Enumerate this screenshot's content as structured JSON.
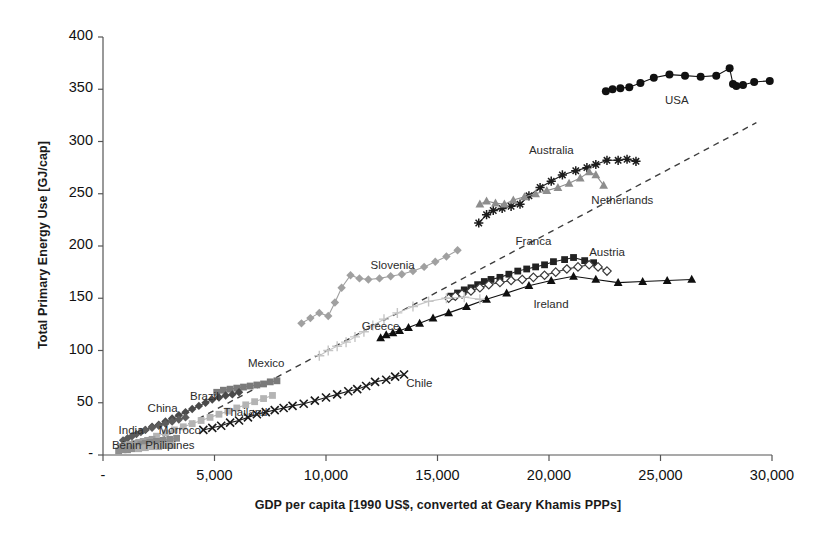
{
  "chart_data": {
    "type": "scatter",
    "title": "",
    "xlabel": "GDP per capita [1990 US$, converted at Geary Khamis PPPs]",
    "ylabel": "Total Primary Energy Use [GJ/cap]",
    "xlim": [
      0,
      30000
    ],
    "ylim": [
      0,
      400
    ],
    "grid": false,
    "legend": "none (series labelled inline on plot)",
    "xticks": [
      0,
      5000,
      10000,
      15000,
      20000,
      25000,
      30000
    ],
    "xticklabels": [
      "-",
      "5,000",
      "10,000",
      "15,000",
      "20,000",
      "25,000",
      "30,000"
    ],
    "yticks": [
      0,
      50,
      100,
      150,
      200,
      250,
      300,
      350,
      400
    ],
    "yticklabels": [
      "-",
      "50",
      "100",
      "150",
      "200",
      "250",
      "300",
      "350",
      "400"
    ],
    "annotations": [
      {
        "text": "USA",
        "x": 25200,
        "y": 338
      },
      {
        "text": "Australia",
        "x": 19100,
        "y": 290
      },
      {
        "text": "Netherlands",
        "x": 21900,
        "y": 242
      },
      {
        "text": "Franca",
        "x": 18500,
        "y": 203
      },
      {
        "text": "Austria",
        "x": 21800,
        "y": 192
      },
      {
        "text": "Ireland",
        "x": 19300,
        "y": 143
      },
      {
        "text": "Slovenia",
        "x": 12000,
        "y": 180
      },
      {
        "text": "Greece",
        "x": 11600,
        "y": 122
      },
      {
        "text": "Mexico",
        "x": 6500,
        "y": 86
      },
      {
        "text": "Chile",
        "x": 13600,
        "y": 67
      },
      {
        "text": "Thailand",
        "x": 5400,
        "y": 39
      },
      {
        "text": "Brazil",
        "x": 3900,
        "y": 55
      },
      {
        "text": "China",
        "x": 2000,
        "y": 43
      },
      {
        "text": "Morroco",
        "x": 2500,
        "y": 22
      },
      {
        "text": "India",
        "x": 700,
        "y": 22
      },
      {
        "text": "Philipines",
        "x": 1900,
        "y": 8
      },
      {
        "text": "Bénin",
        "x": 400,
        "y": 8
      }
    ],
    "trendline": {
      "name": "dashed-reference-line",
      "style": "dashed",
      "color": "#3d3d3d",
      "points": [
        [
          2100,
          10
        ],
        [
          29300,
          318
        ]
      ]
    },
    "series": [
      {
        "name": "USA",
        "marker": "filled-circle",
        "color": "#111111",
        "points": [
          [
            22550,
            348
          ],
          [
            22850,
            350
          ],
          [
            23200,
            351
          ],
          [
            23600,
            352
          ],
          [
            24100,
            356
          ],
          [
            24700,
            361
          ],
          [
            25400,
            364
          ],
          [
            26100,
            363
          ],
          [
            26800,
            362
          ],
          [
            27500,
            363
          ],
          [
            28100,
            370
          ],
          [
            28250,
            355
          ],
          [
            28400,
            353
          ],
          [
            28700,
            354
          ],
          [
            29200,
            357
          ],
          [
            29900,
            358
          ]
        ]
      },
      {
        "name": "Australia",
        "marker": "star",
        "color": "#1c1c1c",
        "points": [
          [
            16850,
            222
          ],
          [
            17200,
            230
          ],
          [
            17500,
            234
          ],
          [
            17900,
            236
          ],
          [
            18300,
            238
          ],
          [
            18700,
            240
          ],
          [
            19100,
            248
          ],
          [
            19600,
            256
          ],
          [
            20100,
            262
          ],
          [
            20600,
            268
          ],
          [
            21200,
            272
          ],
          [
            21700,
            275
          ],
          [
            22100,
            278
          ],
          [
            22600,
            282
          ],
          [
            23100,
            282
          ],
          [
            23500,
            283
          ],
          [
            23900,
            281
          ]
        ]
      },
      {
        "name": "Netherlands",
        "marker": "filled-triangle",
        "color": "#8d8d8d",
        "points": [
          [
            16900,
            240
          ],
          [
            17200,
            243
          ],
          [
            17600,
            241
          ],
          [
            18000,
            240
          ],
          [
            18400,
            244
          ],
          [
            18900,
            247
          ],
          [
            19400,
            250
          ],
          [
            19900,
            253
          ],
          [
            20400,
            256
          ],
          [
            20900,
            260
          ],
          [
            21400,
            265
          ],
          [
            21800,
            271
          ],
          [
            22100,
            268
          ],
          [
            22450,
            258
          ]
        ]
      },
      {
        "name": "Franca",
        "marker": "filled-square",
        "color": "#222222",
        "points": [
          [
            15600,
            152
          ],
          [
            15900,
            155
          ],
          [
            16200,
            158
          ],
          [
            16500,
            160
          ],
          [
            16800,
            163
          ],
          [
            17100,
            166
          ],
          [
            17400,
            168
          ],
          [
            17800,
            170
          ],
          [
            18200,
            173
          ],
          [
            18600,
            176
          ],
          [
            19000,
            178
          ],
          [
            19400,
            180
          ],
          [
            19800,
            182
          ],
          [
            20200,
            185
          ],
          [
            20700,
            187
          ],
          [
            21100,
            189
          ],
          [
            21600,
            186
          ],
          [
            22000,
            184
          ]
        ]
      },
      {
        "name": "Austria",
        "marker": "open-diamond",
        "color": "#3a3a3a",
        "points": [
          [
            15500,
            150
          ],
          [
            15800,
            152
          ],
          [
            16100,
            154
          ],
          [
            16500,
            157
          ],
          [
            16900,
            160
          ],
          [
            17300,
            163
          ],
          [
            17800,
            165
          ],
          [
            18300,
            167
          ],
          [
            18800,
            168
          ],
          [
            19300,
            170
          ],
          [
            19800,
            172
          ],
          [
            20300,
            175
          ],
          [
            20800,
            178
          ],
          [
            21300,
            180
          ],
          [
            21800,
            182
          ],
          [
            22200,
            180
          ],
          [
            22600,
            176
          ]
        ]
      },
      {
        "name": "Ireland",
        "marker": "filled-triangle",
        "color": "#0f0f0f",
        "points": [
          [
            12450,
            112
          ],
          [
            12700,
            115
          ],
          [
            13000,
            117
          ],
          [
            13300,
            119
          ],
          [
            13700,
            122
          ],
          [
            14200,
            126
          ],
          [
            14800,
            131
          ],
          [
            15500,
            136
          ],
          [
            16300,
            142
          ],
          [
            17200,
            149
          ],
          [
            18100,
            155
          ],
          [
            19100,
            162
          ],
          [
            20100,
            167
          ],
          [
            21100,
            171
          ],
          [
            22100,
            168
          ],
          [
            23100,
            165
          ],
          [
            24200,
            166
          ],
          [
            25300,
            167
          ],
          [
            26400,
            168
          ]
        ]
      },
      {
        "name": "Slovenia",
        "marker": "filled-diamond",
        "color": "#a0a0a0",
        "points": [
          [
            8900,
            126
          ],
          [
            9300,
            131
          ],
          [
            9700,
            136
          ],
          [
            10100,
            133
          ],
          [
            10400,
            146
          ],
          [
            10700,
            160
          ],
          [
            11100,
            172
          ],
          [
            11500,
            169
          ],
          [
            11900,
            168
          ],
          [
            12400,
            169
          ],
          [
            12900,
            171
          ],
          [
            13400,
            173
          ],
          [
            13900,
            176
          ],
          [
            14400,
            180
          ],
          [
            14900,
            185
          ],
          [
            15400,
            190
          ],
          [
            15900,
            196
          ]
        ]
      },
      {
        "name": "Greece",
        "marker": "thin-cross",
        "color": "#c5c5c5",
        "points": [
          [
            9700,
            95
          ],
          [
            10100,
            100
          ],
          [
            10500,
            104
          ],
          [
            10900,
            108
          ],
          [
            11300,
            113
          ],
          [
            11700,
            118
          ],
          [
            12100,
            124
          ],
          [
            12600,
            130
          ],
          [
            13200,
            136
          ],
          [
            13900,
            142
          ],
          [
            14600,
            147
          ],
          [
            15400,
            150
          ],
          [
            16200,
            151
          ],
          [
            16900,
            149
          ]
        ]
      },
      {
        "name": "Chile",
        "marker": "x-cross",
        "color": "#1a1a1a",
        "points": [
          [
            4500,
            24
          ],
          [
            4900,
            26
          ],
          [
            5300,
            28
          ],
          [
            5700,
            31
          ],
          [
            6100,
            33
          ],
          [
            6500,
            36
          ],
          [
            6900,
            39
          ],
          [
            7300,
            41
          ],
          [
            7700,
            43
          ],
          [
            8100,
            45
          ],
          [
            8500,
            47
          ],
          [
            9000,
            49
          ],
          [
            9500,
            52
          ],
          [
            10000,
            55
          ],
          [
            10500,
            58
          ],
          [
            11000,
            61
          ],
          [
            11400,
            63
          ],
          [
            11800,
            66
          ],
          [
            12200,
            70
          ],
          [
            12700,
            72
          ],
          [
            13100,
            75
          ],
          [
            13500,
            77
          ]
        ]
      },
      {
        "name": "Mexico",
        "marker": "filled-square",
        "color": "#7a7a7a",
        "points": [
          [
            5100,
            60
          ],
          [
            5400,
            62
          ],
          [
            5700,
            63
          ],
          [
            6000,
            64
          ],
          [
            6300,
            65
          ],
          [
            6600,
            66
          ],
          [
            6900,
            67
          ],
          [
            7200,
            68
          ],
          [
            7500,
            70
          ],
          [
            7800,
            71
          ]
        ]
      },
      {
        "name": "Brazil",
        "marker": "filled-diamond",
        "color": "#4a4a4a",
        "points": [
          [
            1900,
            24
          ],
          [
            2200,
            27
          ],
          [
            2500,
            29
          ],
          [
            2800,
            32
          ],
          [
            3100,
            35
          ],
          [
            3400,
            38
          ],
          [
            3700,
            41
          ],
          [
            4000,
            44
          ],
          [
            4300,
            47
          ],
          [
            4600,
            50
          ],
          [
            4900,
            53
          ],
          [
            5200,
            55
          ],
          [
            5500,
            57
          ],
          [
            5800,
            58
          ],
          [
            6100,
            60
          ]
        ]
      },
      {
        "name": "Thailand",
        "marker": "filled-square",
        "color": "#b4b4b4",
        "points": [
          [
            2400,
            18
          ],
          [
            2800,
            21
          ],
          [
            3200,
            24
          ],
          [
            3600,
            27
          ],
          [
            4000,
            30
          ],
          [
            4400,
            33
          ],
          [
            4800,
            36
          ],
          [
            5200,
            39
          ],
          [
            5600,
            42
          ],
          [
            6000,
            45
          ],
          [
            6400,
            48
          ],
          [
            6800,
            51
          ],
          [
            7200,
            54
          ],
          [
            7600,
            57
          ]
        ]
      },
      {
        "name": "China",
        "marker": "filled-diamond",
        "color": "#5c5c5c",
        "points": [
          [
            900,
            14
          ],
          [
            1100,
            16
          ],
          [
            1300,
            18
          ],
          [
            1500,
            20
          ],
          [
            1700,
            22
          ],
          [
            1900,
            24
          ],
          [
            2200,
            26
          ],
          [
            2500,
            28
          ],
          [
            2800,
            30
          ],
          [
            3100,
            32
          ],
          [
            3400,
            34
          ],
          [
            3700,
            36
          ]
        ]
      },
      {
        "name": "India",
        "marker": "filled-square",
        "color": "#9e9e9e",
        "points": [
          [
            800,
            8
          ],
          [
            1000,
            9
          ],
          [
            1200,
            10
          ],
          [
            1400,
            11
          ],
          [
            1600,
            12
          ],
          [
            1800,
            13
          ],
          [
            2000,
            14
          ],
          [
            2200,
            15
          ]
        ]
      },
      {
        "name": "Morroco",
        "marker": "filled-square",
        "color": "#8a8a8a",
        "points": [
          [
            1700,
            10
          ],
          [
            1900,
            11
          ],
          [
            2100,
            12
          ],
          [
            2400,
            13
          ],
          [
            2700,
            14
          ],
          [
            3000,
            15
          ],
          [
            3300,
            16
          ]
        ]
      },
      {
        "name": "Philipines",
        "marker": "filled-square",
        "color": "#adadad",
        "points": [
          [
            1600,
            6
          ],
          [
            1900,
            7
          ],
          [
            2200,
            8
          ],
          [
            2500,
            8
          ],
          [
            2800,
            9
          ],
          [
            3100,
            9
          ]
        ]
      },
      {
        "name": "Bénin",
        "marker": "filled-square",
        "color": "#8f8f8f",
        "points": [
          [
            700,
            4
          ],
          [
            900,
            5
          ],
          [
            1100,
            5
          ],
          [
            1300,
            6
          ]
        ]
      }
    ]
  },
  "axes": {
    "y_title": "Total Primary Energy Use [GJ/cap]",
    "x_title": "GDP per capita [1990 US$, converted at Geary Khamis PPPs]"
  }
}
